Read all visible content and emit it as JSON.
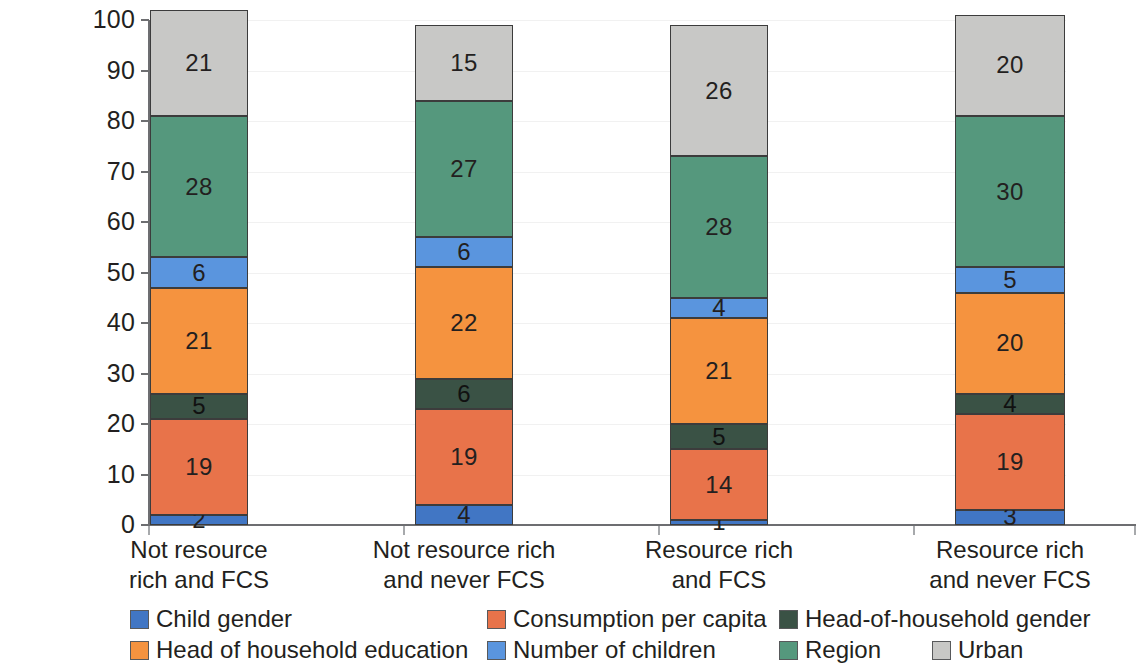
{
  "chart_data": {
    "type": "bar",
    "subtype": "stacked-bar-100",
    "title": "",
    "subtitle": "",
    "xlabel": "",
    "ylabel": "",
    "ylim": [
      0,
      100
    ],
    "yticks": [
      0,
      10,
      20,
      30,
      40,
      50,
      60,
      70,
      80,
      90,
      100
    ],
    "ytick_labels": [
      "0",
      "10",
      "20",
      "30",
      "40",
      "50",
      "60",
      "70",
      "80",
      "90",
      "100"
    ],
    "grid": false,
    "legend_position": "bottom",
    "stack_order": "bottom-to-top",
    "categories": [
      "Not resource rich and FCS",
      "Not resource rich and never FCS",
      "Resource rich and FCS",
      "Resource rich and never FCS"
    ],
    "category_lines": [
      [
        "Not resource",
        "rich and FCS"
      ],
      [
        "Not resource rich",
        "and never FCS"
      ],
      [
        "Resource rich",
        "and FCS"
      ],
      [
        "Resource rich",
        "and never FCS"
      ]
    ],
    "series": [
      {
        "name": "Child gender",
        "color": "#4176c4",
        "values": [
          2,
          4,
          1,
          3
        ]
      },
      {
        "name": "Consumption per capita",
        "color": "#e8734a",
        "values": [
          19,
          19,
          14,
          19
        ]
      },
      {
        "name": "Head-of-household gender",
        "color": "#3a5245",
        "values": [
          5,
          6,
          5,
          4
        ]
      },
      {
        "name": "Head of household education",
        "color": "#f5933f",
        "values": [
          21,
          22,
          21,
          20
        ]
      },
      {
        "name": "Number of children",
        "color": "#5a95de",
        "values": [
          6,
          6,
          4,
          5
        ]
      },
      {
        "name": "Region",
        "color": "#55987d",
        "values": [
          28,
          27,
          28,
          30
        ]
      },
      {
        "name": "Urban",
        "color": "#c8c8c6",
        "values": [
          21,
          15,
          26,
          20
        ]
      }
    ]
  },
  "legend": {
    "rows": [
      [
        {
          "label": "Child gender",
          "color": "#4176c4",
          "left": 130,
          "swatch": "legend-swatch-child-gender"
        },
        {
          "label": "Consumption per capita",
          "color": "#e8734a",
          "left": 487,
          "swatch": "legend-swatch-consumption-per-capita"
        },
        {
          "label": "Head-of-household gender",
          "color": "#3a5245",
          "left": 779,
          "swatch": "legend-swatch-head-of-household-gender"
        }
      ],
      [
        {
          "label": "Head of household education",
          "color": "#f5933f",
          "left": 130,
          "swatch": "legend-swatch-head-of-household-education"
        },
        {
          "label": "Number of children",
          "color": "#5a95de",
          "left": 487,
          "swatch": "legend-swatch-number-of-children"
        },
        {
          "label": "Region",
          "color": "#55987d",
          "left": 779,
          "swatch": "legend-swatch-region"
        },
        {
          "label": "Urban",
          "color": "#c8c8c6",
          "left": 932,
          "swatch": "legend-swatch-urban"
        }
      ]
    ]
  },
  "axis": {
    "y_min": 0,
    "y_max": 100
  }
}
